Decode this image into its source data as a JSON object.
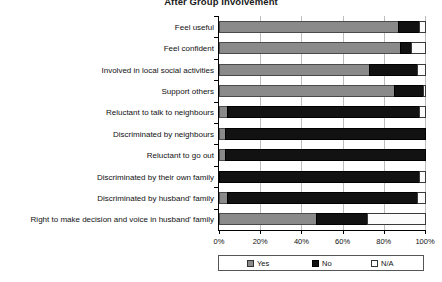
{
  "chart_data": {
    "type": "bar",
    "orientation": "horizontal",
    "stacked": true,
    "title": "After Group Involvement",
    "xlabel": "",
    "ylabel": "",
    "xlim": [
      0,
      100
    ],
    "grid": true,
    "legend_position": "bottom",
    "xticklabels": [
      "0%",
      "20%",
      "40%",
      "60%",
      "80%",
      "100%"
    ],
    "xticks": [
      0,
      20,
      40,
      60,
      80,
      100
    ],
    "categories": [
      "Feel useful",
      "Feel confident",
      "Involved in local social activities",
      "Support others",
      "Reluctant to talk to neighbours",
      "Discriminated by neighbours",
      "Reluctant to go out",
      "Discriminated by their own family",
      "Discriminated by husband' family",
      "Right to make decision and voice in husband' family"
    ],
    "series": [
      {
        "name": "Yes",
        "color": "#8a8a8a",
        "values": [
          87,
          88,
          73,
          85,
          4,
          3,
          3,
          0,
          4,
          47
        ]
      },
      {
        "name": "No",
        "color": "#121212",
        "values": [
          10,
          5,
          23,
          14,
          93,
          97,
          97,
          97,
          92,
          25
        ]
      },
      {
        "name": "N/A",
        "color": "#ffffff",
        "values": [
          3,
          7,
          4,
          1,
          3,
          0,
          0,
          3,
          4,
          28
        ]
      }
    ],
    "legend": [
      {
        "label": "Yes",
        "swatch": "gray-square-swatch"
      },
      {
        "label": "No",
        "swatch": "black-square-swatch"
      },
      {
        "label": "N/A",
        "swatch": "white-square-swatch"
      }
    ]
  }
}
